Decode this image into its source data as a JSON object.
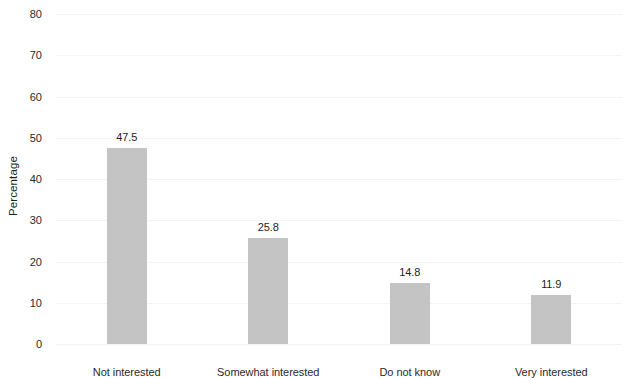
{
  "chart_data": {
    "type": "bar",
    "title": "",
    "subtitle": "",
    "xlabel": "",
    "ylabel": "Percentage",
    "categories": [
      "Not interested",
      "Somewhat interested",
      "Do not know",
      "Very interested"
    ],
    "values": [
      47.5,
      25.8,
      14.8,
      11.9
    ],
    "value_labels": [
      "47.5",
      "25.8",
      "14.8",
      "11.9"
    ],
    "ylim": [
      0,
      80
    ],
    "ytick_values": [
      0,
      10,
      20,
      30,
      40,
      50,
      60,
      70,
      80
    ],
    "ytick_labels": [
      "0",
      "10",
      "20",
      "30",
      "40",
      "50",
      "60",
      "70",
      "80"
    ],
    "grid": true,
    "grid_axis": "y",
    "legend": false,
    "legend_position": "none",
    "bar_color": "#c4c4c4",
    "background_color": "#ffffff",
    "text_color": "#231f20",
    "gridline_color": "#f4f4f5",
    "bar_width_ratio": 0.28,
    "show_value_labels": true
  }
}
